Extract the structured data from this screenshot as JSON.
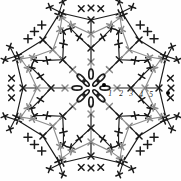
{
  "document": {
    "kind": "crochet-pattern-chart",
    "title": "",
    "background_color": "#fefefe"
  },
  "chart_data": {
    "type": "diagram",
    "title": "",
    "subtitle": "",
    "xlabel": "",
    "ylabel": "",
    "shape": "circular-motif",
    "center": {
      "x": 91,
      "y": 88
    },
    "symmetry": {
      "arms": 8,
      "angle_step_deg": 45,
      "start_angle_deg": 0
    },
    "colors": {
      "round_odd": "#1a1a1a",
      "round_even": "#8c8c8c",
      "marker": "#000000",
      "label": "#1a1a1a"
    },
    "round_labels": [
      "1",
      "2",
      "3",
      "4",
      "5"
    ],
    "round_label_positions": [
      {
        "label": "1",
        "x": 110,
        "y": 96
      },
      {
        "label": "2",
        "x": 121,
        "y": 96
      },
      {
        "label": "3",
        "x": 131,
        "y": 96
      },
      {
        "label": "4",
        "x": 141,
        "y": 97
      },
      {
        "label": "5",
        "x": 151,
        "y": 97
      }
    ],
    "markers": [
      {
        "name": "start-dot",
        "x": 104,
        "y": 85,
        "r": 2.0
      },
      {
        "name": "end-dot",
        "x": 168,
        "y": 93,
        "r": 2.0
      }
    ],
    "center_ring": {
      "symbol": "chain-stitch-oval",
      "count": 8,
      "radius": 14,
      "oval_rx": 2.2,
      "oval_ry": 5.0,
      "color": "#1a1a1a"
    },
    "inner_ring": {
      "symbol": "chain-stitch-oval",
      "count": 4,
      "radius": 7,
      "oval_rx": 1.8,
      "oval_ry": 4.0,
      "color": "#1a1a1a"
    },
    "rounds": [
      {
        "n": 1,
        "radius": 14,
        "stitch_count": 8,
        "symbol": "chain",
        "color": "#1a1a1a"
      },
      {
        "n": 2,
        "radius": 26,
        "stitch_count": 8,
        "symbol": "cross",
        "color": "#8c8c8c"
      },
      {
        "n": 3,
        "radius": 40,
        "stitch_count": 16,
        "symbol": "cross",
        "color": "#1a1a1a"
      },
      {
        "n": 4,
        "radius": 54,
        "stitch_count": 16,
        "symbol": "cross",
        "color": "#8c8c8c"
      },
      {
        "n": 5,
        "radius": 68,
        "stitch_count": 24,
        "symbol": "cross",
        "color": "#1a1a1a"
      }
    ],
    "arms": {
      "count": 8,
      "branch_levels": 3,
      "stitch_symbol": "cross-plus",
      "description": "Eight radiating arms of cross/plus stitch symbols branching outward from a central chain ring, alternating black and gray strokes per round."
    },
    "legend": {
      "entries": [],
      "position": "none"
    },
    "grid": false
  }
}
